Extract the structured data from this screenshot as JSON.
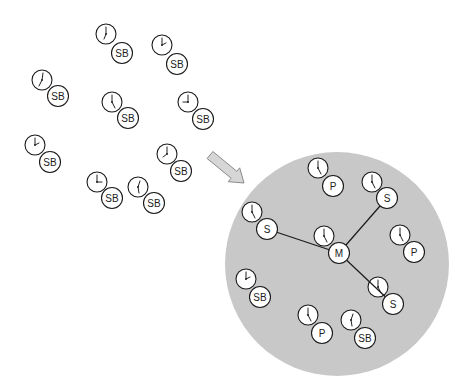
{
  "diagram": {
    "colors": {
      "background": "#ffffff",
      "domain_fill": "#c8c8c8",
      "arrow_fill": "#d6d6d6",
      "arrow_stroke": "#8a8a8a",
      "stroke": "#1a1a1a"
    },
    "arrow": {
      "from": [
        210,
        155
      ],
      "to": [
        244,
        183
      ],
      "label": "transition-arrow"
    },
    "domain_circle": {
      "cx": 337,
      "cy": 264,
      "r": 112
    },
    "outside_nodes": [
      {
        "id": "o1",
        "label": "SB",
        "clock": [
          106,
          34
        ],
        "node": [
          122,
          53
        ],
        "hands": [
          [
            0,
            -7
          ],
          [
            -2,
            5
          ]
        ]
      },
      {
        "id": "o2",
        "label": "SB",
        "clock": [
          162,
          45
        ],
        "node": [
          177,
          64
        ],
        "hands": [
          [
            0,
            -7
          ],
          [
            4,
            -2
          ]
        ]
      },
      {
        "id": "o3",
        "label": "SB",
        "clock": [
          42,
          80
        ],
        "node": [
          58,
          96
        ],
        "hands": [
          [
            1,
            -7
          ],
          [
            -3,
            6
          ]
        ]
      },
      {
        "id": "o4",
        "label": "SB",
        "clock": [
          112,
          102
        ],
        "node": [
          128,
          118
        ],
        "hands": [
          [
            0,
            -7
          ],
          [
            3,
            6
          ]
        ]
      },
      {
        "id": "o5",
        "label": "SB",
        "clock": [
          188,
          102
        ],
        "node": [
          203,
          119
        ],
        "hands": [
          [
            0,
            -7
          ],
          [
            -5,
            0
          ]
        ]
      },
      {
        "id": "o6",
        "label": "SB",
        "clock": [
          35,
          145
        ],
        "node": [
          50,
          162
        ],
        "hands": [
          [
            0,
            -7
          ],
          [
            4,
            -2
          ]
        ]
      },
      {
        "id": "o7",
        "label": "SB",
        "clock": [
          167,
          154
        ],
        "node": [
          181,
          171
        ],
        "hands": [
          [
            0,
            -7
          ],
          [
            -4,
            3
          ]
        ]
      },
      {
        "id": "o8",
        "label": "SB",
        "clock": [
          97,
          182
        ],
        "node": [
          112,
          198
        ],
        "hands": [
          [
            0,
            -7
          ],
          [
            5,
            0
          ]
        ]
      },
      {
        "id": "o9",
        "label": "SB",
        "clock": [
          138,
          187
        ],
        "node": [
          154,
          203
        ],
        "hands": [
          [
            2,
            -6
          ],
          [
            1,
            6
          ]
        ]
      }
    ],
    "inside_nodes": [
      {
        "id": "p_top",
        "label": "P",
        "clock": [
          318,
          168
        ],
        "node": [
          333,
          186
        ],
        "hands": [
          [
            0,
            -7
          ],
          [
            3,
            6
          ]
        ]
      },
      {
        "id": "s_top_right",
        "label": "S",
        "clock": [
          372,
          182
        ],
        "node": [
          387,
          198
        ],
        "hands": [
          [
            0,
            -7
          ],
          [
            3,
            6
          ]
        ]
      },
      {
        "id": "s_left",
        "label": "S",
        "clock": [
          252,
          212
        ],
        "node": [
          267,
          229
        ],
        "hands": [
          [
            0,
            -7
          ],
          [
            3,
            6
          ]
        ]
      },
      {
        "id": "m_center",
        "label": "M",
        "clock": [
          324,
          236
        ],
        "node": [
          339,
          253
        ],
        "hands": [
          [
            0,
            -7
          ],
          [
            3,
            6
          ]
        ]
      },
      {
        "id": "p_right",
        "label": "P",
        "clock": [
          400,
          235
        ],
        "node": [
          414,
          252
        ],
        "hands": [
          [
            0,
            -7
          ],
          [
            3,
            6
          ]
        ]
      },
      {
        "id": "s_bottom_right",
        "label": "S",
        "clock": [
          378,
          287
        ],
        "node": [
          393,
          304
        ],
        "hands": [
          [
            0,
            -7
          ],
          [
            3,
            6
          ]
        ]
      },
      {
        "id": "sb_left",
        "label": "SB",
        "clock": [
          246,
          279
        ],
        "node": [
          260,
          297
        ],
        "hands": [
          [
            0,
            -7
          ],
          [
            4,
            -2
          ]
        ]
      },
      {
        "id": "p_bottom",
        "label": "P",
        "clock": [
          308,
          315
        ],
        "node": [
          322,
          333
        ],
        "hands": [
          [
            0,
            -7
          ],
          [
            3,
            6
          ]
        ]
      },
      {
        "id": "sb_bottom",
        "label": "SB",
        "clock": [
          351,
          320
        ],
        "node": [
          365,
          338
        ],
        "hands": [
          [
            2,
            -6
          ],
          [
            1,
            6
          ]
        ]
      }
    ],
    "links": [
      {
        "from": "m_center",
        "to": "s_left"
      },
      {
        "from": "m_center",
        "to": "s_top_right"
      },
      {
        "from": "m_center",
        "to": "s_bottom_right"
      }
    ],
    "radius": {
      "clock": 10,
      "node": 10.5
    }
  }
}
